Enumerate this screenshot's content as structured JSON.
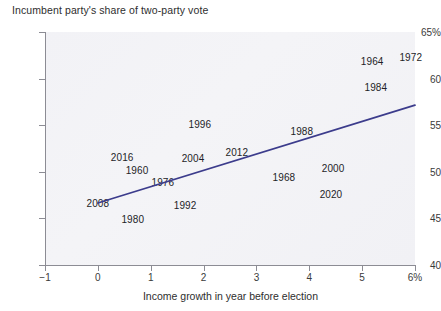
{
  "chart_data": {
    "type": "scatter",
    "title": "Incumbent party's share of two-party vote",
    "xlabel": "Income growth in year before election",
    "ylabel": "",
    "xlim": [
      -1,
      6
    ],
    "ylim": [
      40,
      65
    ],
    "grid": false,
    "legend": "none",
    "x_tick_labels": [
      "−1",
      "0",
      "1",
      "2",
      "3",
      "4",
      "5",
      "6%"
    ],
    "x_tick_values": [
      -1,
      0,
      1,
      2,
      3,
      4,
      5,
      6
    ],
    "y_tick_labels": [
      "65%",
      "60",
      "55",
      "50",
      "45",
      "40"
    ],
    "y_tick_values": [
      65,
      60,
      55,
      50,
      45,
      40
    ],
    "point_label_mode": "year-text-only",
    "points": [
      {
        "label": "2008",
        "x": 0.0,
        "y": 46.6
      },
      {
        "label": "1980",
        "x": 0.66,
        "y": 44.9
      },
      {
        "label": "2016",
        "x": 0.46,
        "y": 51.6
      },
      {
        "label": "1960",
        "x": 0.74,
        "y": 50.2
      },
      {
        "label": "1976",
        "x": 1.23,
        "y": 48.9
      },
      {
        "label": "1992",
        "x": 1.65,
        "y": 46.4
      },
      {
        "label": "2004",
        "x": 1.8,
        "y": 51.5
      },
      {
        "label": "1996",
        "x": 1.93,
        "y": 55.1
      },
      {
        "label": "2012",
        "x": 2.63,
        "y": 52.1
      },
      {
        "label": "1968",
        "x": 3.52,
        "y": 49.4
      },
      {
        "label": "1988",
        "x": 3.86,
        "y": 54.4
      },
      {
        "label": "2020",
        "x": 4.41,
        "y": 47.6
      },
      {
        "label": "2000",
        "x": 4.45,
        "y": 50.4
      },
      {
        "label": "1964",
        "x": 5.19,
        "y": 61.9
      },
      {
        "label": "1984",
        "x": 5.26,
        "y": 59.1
      },
      {
        "label": "1972",
        "x": 5.92,
        "y": 62.3
      }
    ],
    "fit_line": {
      "name": "linear-regression-fit",
      "color": "#3c3c8c",
      "x_start": 0.0,
      "y_start": 46.65,
      "x_end": 6.0,
      "y_end": 57.15
    },
    "colors": {
      "plot_background": "#f2f2f6",
      "axis": "#8c8c94",
      "text": "#2b2b2b",
      "fit_line": "#3c3c8c"
    }
  }
}
